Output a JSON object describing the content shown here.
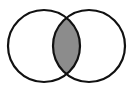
{
  "diagram": {
    "type": "venn",
    "sets": [
      {
        "id": "A",
        "label": "",
        "cx": 44,
        "cy": 46,
        "r": 36
      },
      {
        "id": "B",
        "label": "",
        "cx": 89,
        "cy": 46,
        "r": 36
      }
    ],
    "highlighted_region": "A ∩ B",
    "colors": {
      "stroke": "#111111",
      "intersection_fill": "#8c8c8c",
      "background": "#ffffff"
    }
  }
}
